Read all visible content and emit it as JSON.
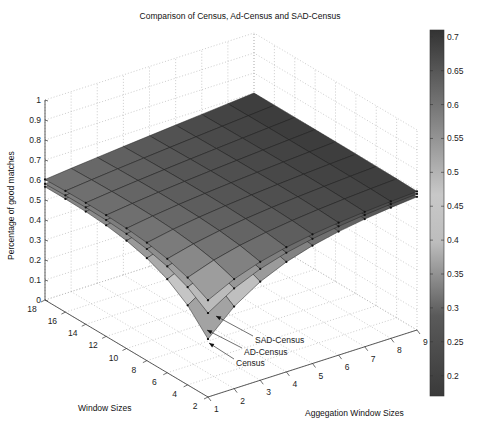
{
  "chart_data": {
    "type": "surface3d",
    "title": "Comparison of Census, Ad-Census and SAD-Census",
    "xlabel": "Aggegation Window Sizes",
    "ylabel": "Window Sizes",
    "zlabel": "Percentage of good matches",
    "x": [
      1,
      2,
      3,
      4,
      5,
      6,
      7,
      8,
      9
    ],
    "y": [
      2,
      4,
      6,
      8,
      10,
      12,
      14,
      16,
      18
    ],
    "xlim": [
      1,
      9
    ],
    "ylim": [
      2,
      18
    ],
    "zlim": [
      0,
      1
    ],
    "x_ticks": [
      "1",
      "2",
      "3",
      "4",
      "5",
      "6",
      "7",
      "8",
      "9"
    ],
    "y_ticks": [
      "2",
      "4",
      "6",
      "8",
      "10",
      "12",
      "14",
      "16",
      "18"
    ],
    "z_ticks": [
      "0",
      "0.1",
      "0.2",
      "0.3",
      "0.4",
      "0.5",
      "0.6",
      "0.7",
      "0.8",
      "0.9",
      "1"
    ],
    "grid": true,
    "colormap": "gray-diverging",
    "colorbar": {
      "range": [
        0.17,
        0.71
      ],
      "ticks": [
        "0.7",
        "0.65",
        "0.6",
        "0.55",
        "0.5",
        "0.45",
        "0.4",
        "0.35",
        "0.3",
        "0.25",
        "0.2"
      ]
    },
    "series": [
      {
        "name": "SAD-Census",
        "corner_value_x1_y2": 0.37,
        "plateau_value": 0.7,
        "left_edge_y18": 0.61
      },
      {
        "name": "AD-Census",
        "corner_value_x1_y2": 0.3,
        "plateau_value": 0.69,
        "left_edge_y18": 0.59
      },
      {
        "name": "Census",
        "corner_value_x1_y2": 0.17,
        "plateau_value": 0.68,
        "left_edge_y18": 0.58
      }
    ],
    "annotations": [
      {
        "text": "SAD-Census"
      },
      {
        "text": "AD-Census"
      },
      {
        "text": "Census"
      }
    ]
  }
}
